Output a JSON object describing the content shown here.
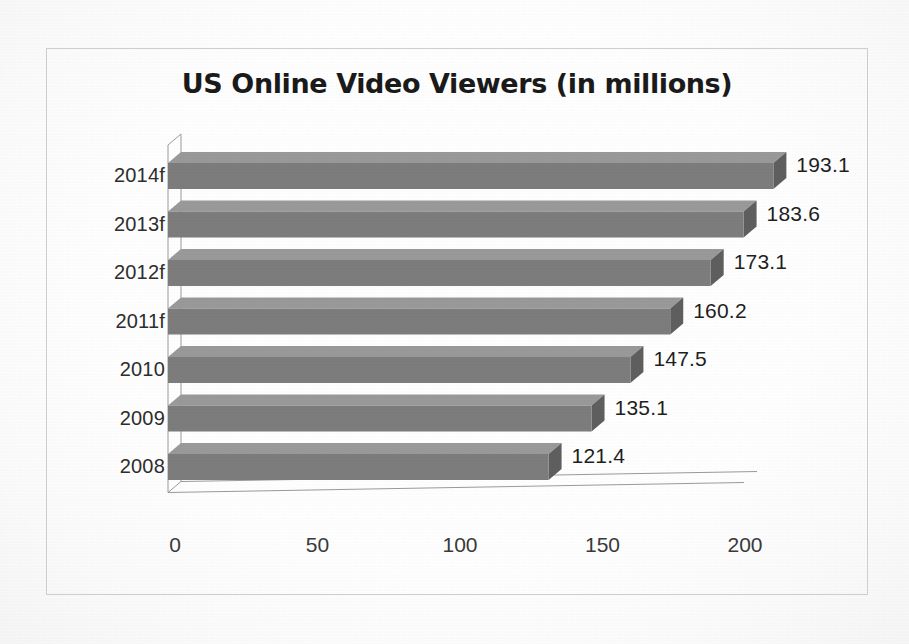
{
  "chart_data": {
    "type": "bar",
    "orientation": "horizontal",
    "title": "US Online Video Viewers (in millions)",
    "xlabel": "",
    "ylabel": "",
    "categories": [
      "2008",
      "2009",
      "2010",
      "2011f",
      "2012f",
      "2013f",
      "2014f"
    ],
    "values": [
      121.4,
      135.1,
      147.5,
      160.2,
      173.1,
      183.6,
      193.1
    ],
    "data_labels": [
      "121.4",
      "135.1",
      "147.5",
      "160.2",
      "173.1",
      "183.6",
      "193.1"
    ],
    "display_order_top_to_bottom": [
      "2014f",
      "2013f",
      "2012f",
      "2011f",
      "2010",
      "2009",
      "2008"
    ],
    "xticks": [
      0,
      50,
      100,
      150,
      200
    ],
    "xtick_labels": [
      "0",
      "50",
      "100",
      "150",
      "200"
    ],
    "xlim": [
      0,
      200
    ],
    "grid": false,
    "legend": false,
    "style": "3d",
    "bar_color": "#7d7d7d",
    "bar_side_color": "#5f5f5f",
    "bar_top_color": "#9a9a9a",
    "axis_color": "#9b9b9b",
    "frame_color": "#cfcfcf",
    "title_color": "#1b1b1b",
    "label_color": "#2e2e2e",
    "background": "#fdfdfd",
    "rows": [
      {
        "category": "2014f",
        "value": 193.1,
        "label": "193.1"
      },
      {
        "category": "2013f",
        "value": 183.6,
        "label": "183.6"
      },
      {
        "category": "2012f",
        "value": 173.1,
        "label": "173.1"
      },
      {
        "category": "2011f",
        "value": 160.2,
        "label": "160.2"
      },
      {
        "category": "2010",
        "value": 147.5,
        "label": "147.5"
      },
      {
        "category": "2009",
        "value": 135.1,
        "label": "135.1"
      },
      {
        "category": "2008",
        "value": 121.4,
        "label": "121.4"
      }
    ]
  }
}
